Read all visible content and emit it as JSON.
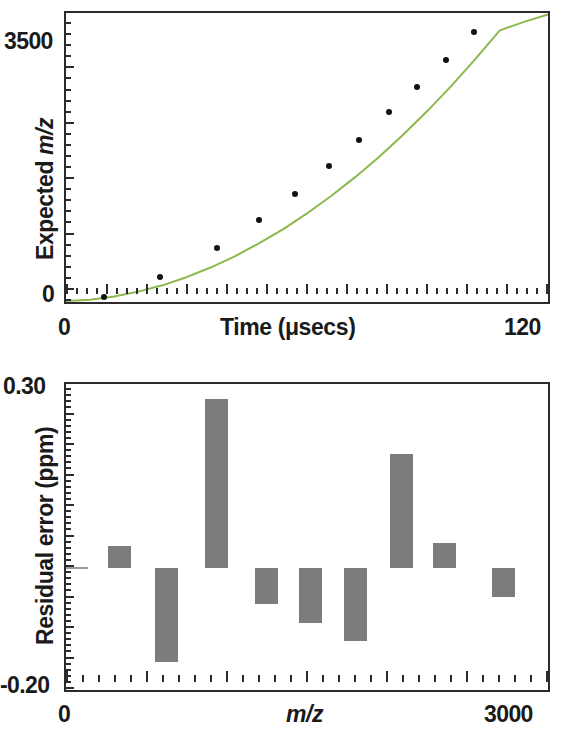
{
  "figure": {
    "background": "#ffffff",
    "curve_color": "#8cb84b",
    "bar_color": "#7c7c7c",
    "axis_color": "#2b2b2b",
    "point_color": "#111111"
  },
  "top_panel": {
    "y_axis_label": "Expected ",
    "y_axis_label_italic": "m/z",
    "y_tick_top": "3500",
    "y_tick_bottom": "0",
    "x_axis_label_plain": "Time (",
    "x_axis_label_unit": "μsecs",
    "x_axis_label_close": ")",
    "x_axis_label_full": "Time (μsecs)",
    "x_tick_left": "0",
    "x_tick_right": "120"
  },
  "bottom_panel": {
    "y_axis_label": "Residual error (ppm)",
    "y_tick_top": "0.30",
    "y_tick_bottom": "-0.20",
    "x_axis_label": "m/z",
    "x_tick_left": "0",
    "x_tick_right": "3000"
  },
  "chart_data": [
    {
      "id": "calibration-curve",
      "type": "line",
      "title": "",
      "xlabel": "Time (μsecs)",
      "ylabel": "Expected m/z",
      "xlim": [
        0,
        120
      ],
      "ylim": [
        0,
        3900
      ],
      "grid": false,
      "legend": "none",
      "x_ticks_labeled": [
        0,
        120
      ],
      "y_ticks_labeled": [
        0,
        3500
      ],
      "minor_tick_count_x": 48,
      "minor_tick_count_y": 26,
      "series": [
        {
          "name": "quadratic fit",
          "kind": "line",
          "color": "#8cb84b",
          "x": [
            0,
            6,
            12,
            18,
            24,
            30,
            36,
            42,
            48,
            54,
            60,
            66,
            72,
            78,
            84,
            90,
            96,
            102,
            108,
            114,
            120
          ],
          "y": [
            12,
            30,
            75,
            140,
            225,
            335,
            465,
            615,
            790,
            980,
            1195,
            1430,
            1685,
            1960,
            2260,
            2580,
            2920,
            3285,
            3665,
            3780,
            3880
          ]
        },
        {
          "name": "measured calibrant ions",
          "kind": "scatter",
          "color": "#111111",
          "x": [
            9.5,
            23.5,
            37.5,
            48.0,
            57.0,
            65.5,
            73.0,
            80.5,
            87.5,
            94.5,
            101.5
          ],
          "y": [
            72,
            340,
            730,
            1110,
            1460,
            1830,
            2180,
            2560,
            2900,
            3270,
            3640
          ]
        }
      ]
    },
    {
      "id": "residual-error",
      "type": "bar",
      "title": "",
      "xlabel": "m/z",
      "ylabel": "Residual error (ppm)",
      "xlim": [
        0,
        3000
      ],
      "ylim": [
        -0.2,
        0.3
      ],
      "grid": false,
      "legend": "none",
      "x_ticks_labeled": [
        0,
        3000
      ],
      "y_ticks_labeled": [
        -0.2,
        0.3
      ],
      "minor_tick_count_x": 30,
      "minor_tick_count_y": 50,
      "zero_baseline": 0.0,
      "categories": [
        320,
        640,
        900,
        1130,
        1330,
        1520,
        1700,
        1880,
        2080,
        2300,
        2620
      ],
      "values": [
        0.035,
        -0.155,
        0.275,
        -0.06,
        -0.09,
        -0.12,
        0.185,
        0.04,
        -0.07
      ]
    }
  ],
  "bars": [
    {
      "label": "bar-1",
      "x_center": 330,
      "value_top": 0.035,
      "value_bottom": 0.0
    },
    {
      "label": "bar-2",
      "x_center": 625,
      "value_top": 0.0,
      "value_bottom": -0.155
    },
    {
      "label": "bar-3",
      "x_center": 935,
      "value_top": 0.275,
      "value_bottom": 0.0
    },
    {
      "label": "bar-4",
      "x_center": 1250,
      "value_top": 0.0,
      "value_bottom": -0.06
    },
    {
      "label": "bar-5",
      "x_center": 1520,
      "value_top": 0.0,
      "value_bottom": -0.09
    },
    {
      "label": "bar-6",
      "x_center": 1800,
      "value_top": 0.0,
      "value_bottom": -0.12
    },
    {
      "label": "bar-7",
      "x_center": 2090,
      "value_top": 0.185,
      "value_bottom": 0.0
    },
    {
      "label": "bar-8",
      "x_center": 2355,
      "value_top": 0.04,
      "value_bottom": 0.0
    },
    {
      "label": "bar-9",
      "x_center": 2720,
      "value_top": 0.0,
      "value_bottom": -0.048
    }
  ]
}
